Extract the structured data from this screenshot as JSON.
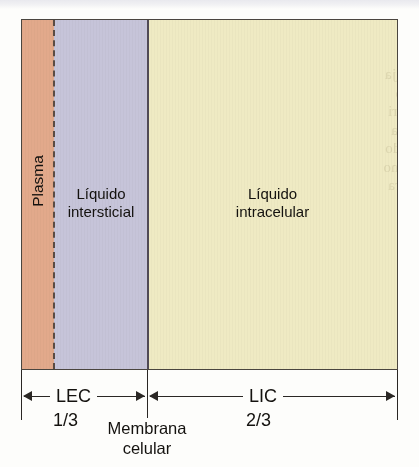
{
  "figure": {
    "ghost_text": "sem tirar o modo\no eritrócito se retrai\nvolume que de água, ja\nlar aumenta em razão\nmo do não há equilíbri\nde célula. A concentra\nos celulares é maior do\nvez o que implica o mo\nte caso mais concentra"
  },
  "compartments": [
    {
      "id": "plasma",
      "label": "Plasma",
      "color": "#e2a98b",
      "orientation": "vertical"
    },
    {
      "id": "interstitial",
      "label": "Líquido\ninterstitial_placeholder",
      "color": "#c6c4d9",
      "orientation": "horizontal"
    },
    {
      "id": "intracellular",
      "label": "Líquido\nintracelular",
      "color": "#efeac3",
      "orientation": "horizontal"
    }
  ],
  "labels": {
    "plasma": "Plasma",
    "interstitial": "Líquido\nintersticial",
    "intracellular": "Líquido\nintracelular"
  },
  "dividers": {
    "plasma_interstitial": {
      "name": "dashed-divider",
      "style": "dashed",
      "color": "#5a4b43"
    },
    "cell_membrane": {
      "name": "membrane-line",
      "style": "solid",
      "color": "#504a55",
      "label": "Membrana\ncelular"
    }
  },
  "dimensions": [
    {
      "id": "lec",
      "label": "LEC",
      "fraction": "1/3",
      "meaning": "Líquido extracelular"
    },
    {
      "id": "lic",
      "label": "LIC",
      "fraction": "2/3",
      "meaning": "Líquido intracelular"
    }
  ],
  "chart_data": {
    "type": "bar",
    "orientation": "horizontal-stacked",
    "categories": [
      "Plasma",
      "Líquido intersticial",
      "Líquido intracelular"
    ],
    "values": [
      8.5,
      24.9,
      66.6
    ],
    "value_unit": "% da água corporal total",
    "groups": [
      {
        "name": "LEC",
        "fraction": "1/3",
        "members": [
          "Plasma",
          "Líquido intersticial"
        ]
      },
      {
        "name": "LIC",
        "fraction": "2/3",
        "members": [
          "Líquido intracelular"
        ]
      }
    ],
    "colors": [
      "#e2a98b",
      "#c6c4d9",
      "#efeac3"
    ],
    "xlabel": "",
    "ylabel": "",
    "grid": false,
    "legend": "none"
  }
}
